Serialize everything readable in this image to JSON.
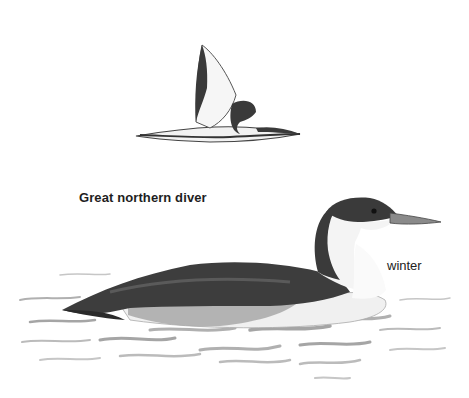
{
  "illustration": {
    "species_label": "Great northern diver",
    "plumage_label": "winter",
    "subjects": [
      {
        "name": "flying-diver",
        "pose": "flight"
      },
      {
        "name": "swimming-diver",
        "pose": "swimming"
      }
    ],
    "colors": {
      "background": "#ffffff",
      "dark_plumage": "#3a3a3a",
      "mid_plumage": "#6e6e6e",
      "light_plumage": "#f4f4f4",
      "water": "#9a9a9a"
    }
  }
}
